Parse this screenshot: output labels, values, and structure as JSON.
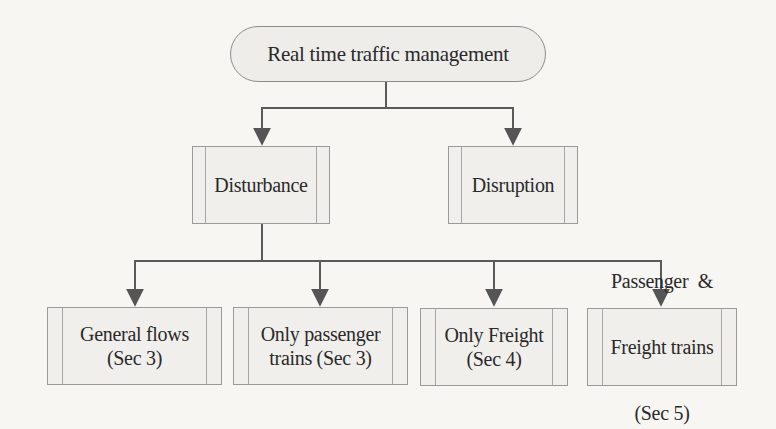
{
  "diagram": {
    "type": "hierarchy",
    "root": {
      "label": "Real time traffic management"
    },
    "level1": [
      {
        "label": "Disturbance"
      },
      {
        "label": "Disruption"
      }
    ],
    "level2_parent": "Disturbance",
    "level2": [
      {
        "label_line1": "General flows",
        "label_line2": "(Sec 3)"
      },
      {
        "label_line1": "Only passenger",
        "label_line2": "trains (Sec 3)"
      },
      {
        "label_line1": "Only Freight",
        "label_line2": "(Sec 4)"
      },
      {
        "label_line1": "Passenger  &",
        "label_line2": "Freight trains",
        "label_line3": "(Sec 5)"
      }
    ],
    "colors": {
      "background": "#f7f6f3",
      "box_fill": "#f0efec",
      "box_border": "#9a9a9a",
      "connector": "#555555",
      "text": "#2a2a2a"
    }
  }
}
